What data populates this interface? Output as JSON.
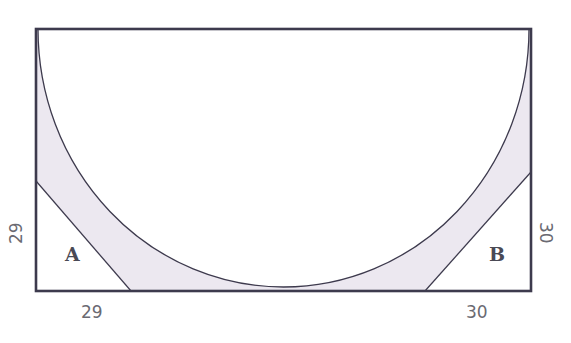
{
  "diagram": {
    "type": "geometry-figure",
    "colors": {
      "stroke": "#3d3a4d",
      "shade": "#ece8f0",
      "background": "#ffffff",
      "label": "#6a6a72"
    },
    "triangles": [
      {
        "id": "A",
        "label": "A",
        "corner": "bottom-left",
        "leg_vertical": "29",
        "leg_horizontal": "29"
      },
      {
        "id": "B",
        "label": "B",
        "corner": "bottom-right",
        "leg_vertical": "30",
        "leg_horizontal": "30"
      }
    ],
    "labels": {
      "A_vertical": "29",
      "A_horizontal": "29",
      "B_vertical": "30",
      "B_horizontal": "30",
      "region_A": "A",
      "region_B": "B"
    }
  }
}
